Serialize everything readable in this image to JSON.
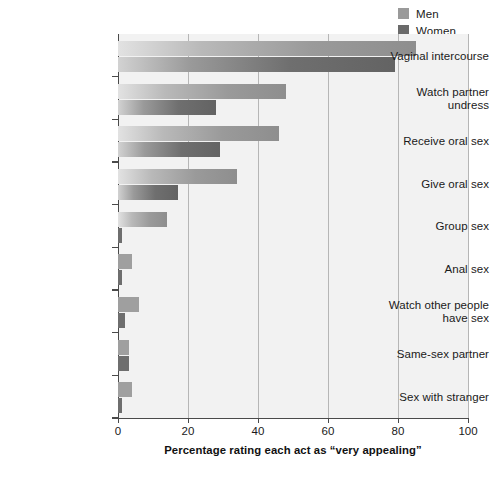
{
  "legend": {
    "position": "top-right",
    "entries": [
      {
        "label": "Men",
        "color": "#9a9a9a"
      },
      {
        "label": "Women",
        "color": "#6a6a6a"
      }
    ]
  },
  "axis": {
    "x_title": "Percentage rating each act as “very appealing”",
    "x_ticks": [
      "0",
      "20",
      "40",
      "60",
      "80",
      "100"
    ]
  },
  "chart_data": {
    "type": "bar",
    "orientation": "horizontal",
    "title": "",
    "subtitle": "",
    "xlabel": "Percentage rating each act as “very appealing”",
    "ylabel": "",
    "xlim": [
      0,
      100
    ],
    "xticks": [
      0,
      20,
      40,
      60,
      80,
      100
    ],
    "grid": "vertical",
    "legend_position": "top-right",
    "categories": [
      "Vaginal intercourse",
      "Watch partner undress",
      "Receive oral sex",
      "Give oral sex",
      "Group sex",
      "Anal sex",
      "Watch other people have sex",
      "Same-sex partner",
      "Sex with stranger"
    ],
    "series": [
      {
        "name": "Men",
        "color": "#9a9a9a",
        "values": [
          85,
          48,
          46,
          34,
          14,
          4,
          6,
          3,
          4
        ]
      },
      {
        "name": "Women",
        "color": "#6a6a6a",
        "values": [
          79,
          28,
          29,
          17,
          1,
          1,
          2,
          3,
          1
        ]
      }
    ]
  }
}
